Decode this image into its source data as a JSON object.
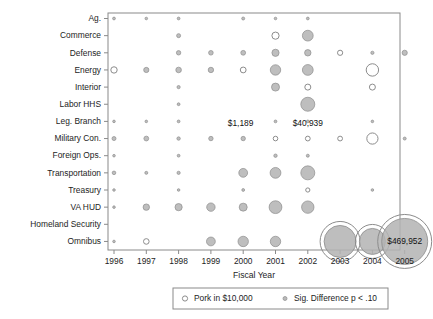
{
  "chart_data": {
    "type": "scatter",
    "title": "",
    "xlabel": "Fiscal Year",
    "ylabel": "",
    "x": [
      1996,
      1997,
      1998,
      1999,
      2000,
      2001,
      2002,
      2003,
      2004,
      2005
    ],
    "xticklabels": [
      "1996",
      "1997",
      "1998",
      "1999",
      "2000",
      "2001",
      "2002",
      "2003",
      "2004",
      "2005"
    ],
    "categories": [
      "Ag.",
      "Commerce",
      "Defense",
      "Energy",
      "Interior",
      "Labor HHS",
      "Leg. Branch",
      "Military Con.",
      "Foreign Ops.",
      "Transportation",
      "Treasury",
      "VA HUD",
      "Homeland Security",
      "Omnibus"
    ],
    "grid": false,
    "legend_position": "bottom",
    "legend": [
      {
        "marker": "open-circle",
        "label": "Pork in $10,000"
      },
      {
        "marker": "filled-circle",
        "label": "Sig. Difference p < .10"
      }
    ],
    "annotations": [
      {
        "text": "$1,189",
        "category": "Labor HHS",
        "x": 1998
      },
      {
        "text": "$40,939",
        "category": "Labor HHS",
        "x": 2002
      },
      {
        "text": "$469,952",
        "category": "Omnibus",
        "x": 2005
      }
    ],
    "bubbles": [
      {
        "category": "Ag.",
        "x": 1996,
        "size": 1.4,
        "fill": "sig"
      },
      {
        "category": "Ag.",
        "x": 1997,
        "size": 1.3,
        "fill": "sig"
      },
      {
        "category": "Ag.",
        "x": 1998,
        "size": 1.4,
        "fill": "sig"
      },
      {
        "category": "Ag.",
        "x": 2000,
        "size": 1.5,
        "fill": "sig"
      },
      {
        "category": "Ag.",
        "x": 2001,
        "size": 1.3,
        "fill": "sig"
      },
      {
        "category": "Ag.",
        "x": 2002,
        "size": 1.4,
        "fill": "sig"
      },
      {
        "category": "Commerce",
        "x": 1998,
        "size": 2.0,
        "fill": "sig"
      },
      {
        "category": "Commerce",
        "x": 2001,
        "size": 3.6,
        "fill": "open"
      },
      {
        "category": "Commerce",
        "x": 2002,
        "size": 5.4,
        "fill": "sig"
      },
      {
        "category": "Defense",
        "x": 1998,
        "size": 2.2,
        "fill": "sig"
      },
      {
        "category": "Defense",
        "x": 1999,
        "size": 2.3,
        "fill": "sig"
      },
      {
        "category": "Defense",
        "x": 2000,
        "size": 2.4,
        "fill": "sig"
      },
      {
        "category": "Defense",
        "x": 2001,
        "size": 3.6,
        "fill": "sig"
      },
      {
        "category": "Defense",
        "x": 2002,
        "size": 3.2,
        "fill": "sig"
      },
      {
        "category": "Defense",
        "x": 2003,
        "size": 2.6,
        "fill": "open"
      },
      {
        "category": "Defense",
        "x": 2004,
        "size": 1.6,
        "fill": "sig"
      },
      {
        "category": "Defense",
        "x": 2005,
        "size": 2.6,
        "fill": "sig"
      },
      {
        "category": "Energy",
        "x": 1996,
        "size": 3.2,
        "fill": "open"
      },
      {
        "category": "Energy",
        "x": 1997,
        "size": 2.6,
        "fill": "sig"
      },
      {
        "category": "Energy",
        "x": 1998,
        "size": 2.8,
        "fill": "sig"
      },
      {
        "category": "Energy",
        "x": 1999,
        "size": 2.7,
        "fill": "sig"
      },
      {
        "category": "Energy",
        "x": 2000,
        "size": 2.9,
        "fill": "open"
      },
      {
        "category": "Energy",
        "x": 2001,
        "size": 5.2,
        "fill": "sig"
      },
      {
        "category": "Energy",
        "x": 2002,
        "size": 5.4,
        "fill": "sig"
      },
      {
        "category": "Energy",
        "x": 2004,
        "size": 6.2,
        "fill": "open"
      },
      {
        "category": "Interior",
        "x": 1998,
        "size": 1.6,
        "fill": "sig"
      },
      {
        "category": "Interior",
        "x": 2001,
        "size": 4.0,
        "fill": "sig"
      },
      {
        "category": "Interior",
        "x": 2002,
        "size": 3.0,
        "fill": "open"
      },
      {
        "category": "Interior",
        "x": 2004,
        "size": 3.0,
        "fill": "open"
      },
      {
        "category": "Labor HHS",
        "x": 1998,
        "size": 1.4,
        "fill": "sig"
      },
      {
        "category": "Labor HHS",
        "x": 2002,
        "size": 7.0,
        "fill": "sig"
      },
      {
        "category": "Leg. Branch",
        "x": 1996,
        "size": 1.3,
        "fill": "sig"
      },
      {
        "category": "Leg. Branch",
        "x": 1997,
        "size": 1.3,
        "fill": "sig"
      },
      {
        "category": "Leg. Branch",
        "x": 1998,
        "size": 1.4,
        "fill": "sig"
      },
      {
        "category": "Leg. Branch",
        "x": 2001,
        "size": 1.4,
        "fill": "sig"
      },
      {
        "category": "Leg. Branch",
        "x": 2002,
        "size": 1.4,
        "fill": "sig"
      },
      {
        "category": "Leg. Branch",
        "x": 2004,
        "size": 1.3,
        "fill": "sig"
      },
      {
        "category": "Military Con.",
        "x": 1996,
        "size": 2.0,
        "fill": "sig"
      },
      {
        "category": "Military Con.",
        "x": 1997,
        "size": 2.4,
        "fill": "sig"
      },
      {
        "category": "Military Con.",
        "x": 1998,
        "size": 1.7,
        "fill": "sig"
      },
      {
        "category": "Military Con.",
        "x": 1999,
        "size": 2.2,
        "fill": "sig"
      },
      {
        "category": "Military Con.",
        "x": 2000,
        "size": 2.2,
        "fill": "sig"
      },
      {
        "category": "Military Con.",
        "x": 2001,
        "size": 2.3,
        "fill": "open"
      },
      {
        "category": "Military Con.",
        "x": 2002,
        "size": 2.4,
        "fill": "open"
      },
      {
        "category": "Military Con.",
        "x": 2003,
        "size": 2.4,
        "fill": "open"
      },
      {
        "category": "Military Con.",
        "x": 2004,
        "size": 5.6,
        "fill": "open"
      },
      {
        "category": "Military Con.",
        "x": 2005,
        "size": 1.5,
        "fill": "sig"
      },
      {
        "category": "Foreign Ops.",
        "x": 1996,
        "size": 1.3,
        "fill": "sig"
      },
      {
        "category": "Foreign Ops.",
        "x": 1998,
        "size": 1.4,
        "fill": "sig"
      },
      {
        "category": "Foreign Ops.",
        "x": 2001,
        "size": 1.7,
        "fill": "sig"
      },
      {
        "category": "Foreign Ops.",
        "x": 2002,
        "size": 1.5,
        "fill": "sig"
      },
      {
        "category": "Transportation",
        "x": 1996,
        "size": 1.8,
        "fill": "sig"
      },
      {
        "category": "Transportation",
        "x": 1997,
        "size": 1.5,
        "fill": "sig"
      },
      {
        "category": "Transportation",
        "x": 1998,
        "size": 1.6,
        "fill": "sig"
      },
      {
        "category": "Transportation",
        "x": 2000,
        "size": 4.4,
        "fill": "sig"
      },
      {
        "category": "Transportation",
        "x": 2001,
        "size": 5.4,
        "fill": "sig"
      },
      {
        "category": "Transportation",
        "x": 2002,
        "size": 7.0,
        "fill": "sig"
      },
      {
        "category": "Treasury",
        "x": 1996,
        "size": 1.3,
        "fill": "sig"
      },
      {
        "category": "Treasury",
        "x": 1998,
        "size": 1.3,
        "fill": "sig"
      },
      {
        "category": "Treasury",
        "x": 2000,
        "size": 1.4,
        "fill": "sig"
      },
      {
        "category": "Treasury",
        "x": 2002,
        "size": 2.1,
        "fill": "open"
      },
      {
        "category": "Treasury",
        "x": 2004,
        "size": 1.3,
        "fill": "sig"
      },
      {
        "category": "VA HUD",
        "x": 1996,
        "size": 1.3,
        "fill": "sig"
      },
      {
        "category": "VA HUD",
        "x": 1997,
        "size": 3.2,
        "fill": "sig"
      },
      {
        "category": "VA HUD",
        "x": 1998,
        "size": 3.6,
        "fill": "sig"
      },
      {
        "category": "VA HUD",
        "x": 1999,
        "size": 4.2,
        "fill": "sig"
      },
      {
        "category": "VA HUD",
        "x": 2000,
        "size": 4.0,
        "fill": "sig"
      },
      {
        "category": "VA HUD",
        "x": 2001,
        "size": 6.4,
        "fill": "sig"
      },
      {
        "category": "VA HUD",
        "x": 2002,
        "size": 6.2,
        "fill": "sig"
      },
      {
        "category": "Omnibus",
        "x": 1996,
        "size": 1.3,
        "fill": "sig"
      },
      {
        "category": "Omnibus",
        "x": 1997,
        "size": 2.8,
        "fill": "open"
      },
      {
        "category": "Omnibus",
        "x": 1999,
        "size": 4.4,
        "fill": "sig"
      },
      {
        "category": "Omnibus",
        "x": 2000,
        "size": 5.2,
        "fill": "sig"
      },
      {
        "category": "Omnibus",
        "x": 2001,
        "size": 5.2,
        "fill": "sig"
      },
      {
        "category": "Omnibus",
        "x": 2003,
        "size": 16.0,
        "fill": "sig-ring"
      },
      {
        "category": "Omnibus",
        "x": 2004,
        "size": 13.0,
        "fill": "sig-ring"
      },
      {
        "category": "Omnibus",
        "x": 2005,
        "size": 23.0,
        "fill": "sig-ring"
      }
    ],
    "colors": {
      "bubble_fill": "#b3b3b3",
      "bubble_stroke": "#8c8c8c",
      "axis": "#8a8a8a",
      "text": "#1d1d1d"
    }
  }
}
